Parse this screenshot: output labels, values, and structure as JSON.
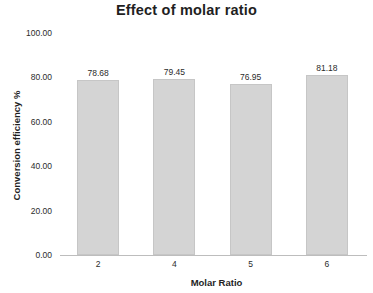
{
  "chart_data": {
    "type": "bar",
    "title": "Effect of molar ratio",
    "xlabel": "Molar Ratio",
    "ylabel": "Conversion efficiency %",
    "categories": [
      "2",
      "4",
      "5",
      "6"
    ],
    "values": [
      78.68,
      79.45,
      76.95,
      81.18
    ],
    "value_labels": [
      "78.68",
      "79.45",
      "76.95",
      "81.18"
    ],
    "ylim": [
      0,
      100
    ],
    "ytick_labels": [
      "100.00",
      "80.00",
      "60.00",
      "40.00",
      "20.00",
      "0.00"
    ],
    "ytick_values": [
      100,
      80,
      60,
      40,
      20,
      0
    ],
    "grid": false,
    "legend": false,
    "bar_color": "#d4d4d4",
    "bar_border_color": "#c6c6c6",
    "axis_color": "#bdbdbd",
    "background_color": "#ffffff",
    "text_color": "#1f1f1f"
  }
}
